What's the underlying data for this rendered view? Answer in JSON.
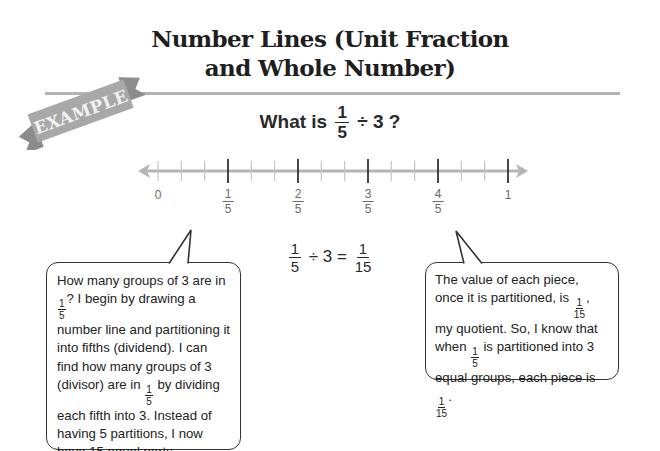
{
  "title": {
    "line1": "Number Lines (Unit Fraction",
    "line2": "and Whole Number)"
  },
  "banner": {
    "label": "EXAMPLE",
    "color": "#a8a8a8"
  },
  "question": {
    "prefix": "What is",
    "fraction": {
      "num": "1",
      "den": "5"
    },
    "suffix": "÷ 3 ?"
  },
  "number_line": {
    "range": [
      0,
      1
    ],
    "minor_divisions": 15,
    "major_divisions": 5,
    "labels": [
      {
        "type": "whole",
        "text": "0"
      },
      {
        "type": "fraction",
        "num": "1",
        "den": "5"
      },
      {
        "type": "fraction",
        "num": "2",
        "den": "5"
      },
      {
        "type": "fraction",
        "num": "3",
        "den": "5"
      },
      {
        "type": "fraction",
        "num": "4",
        "den": "5"
      },
      {
        "type": "whole",
        "text": "1"
      }
    ],
    "line_color": "#b5b5b5",
    "major_tick_color": "#333333",
    "minor_tick_color": "#c4c4c4"
  },
  "equation": {
    "lhs": {
      "num": "1",
      "den": "5"
    },
    "op": "÷ 3 =",
    "rhs": {
      "num": "1",
      "den": "15"
    }
  },
  "bubbles": {
    "left": {
      "seg1": "How many groups of 3 are in",
      "frac1": {
        "num": "1",
        "den": "5"
      },
      "seg2": "? I begin by drawing a number line and partitioning it into fifths (dividend). I can find how many groups of 3 (divisor) are in",
      "frac2": {
        "num": "1",
        "den": "5"
      },
      "seg3": "by dividing each fifth into 3. Instead of having 5 partitions, I now have 15 equal parts."
    },
    "right": {
      "seg1": "The value of each piece, once it is partitioned, is",
      "frac1": {
        "num": "1",
        "den": "15"
      },
      "seg2": ", my quotient. So, I know that when",
      "frac2": {
        "num": "1",
        "den": "5"
      },
      "seg3": "is partitioned into 3 equal groups, each piece is",
      "frac3": {
        "num": "1",
        "den": "15"
      },
      "seg4": "."
    }
  }
}
